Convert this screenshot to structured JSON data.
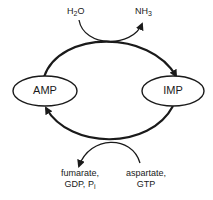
{
  "diagram": {
    "type": "purine nucleotide cycle",
    "nodes": [
      {
        "id": "amp",
        "label": "AMP"
      },
      {
        "id": "imp",
        "label": "IMP"
      }
    ],
    "top_reaction": {
      "input": {
        "base": "H",
        "sub": "2",
        "tail": "O"
      },
      "output": {
        "base": "NH",
        "sub": "3",
        "tail": ""
      },
      "direction": "AMP to IMP"
    },
    "bottom_reaction": {
      "inputs_line1": "aspartate,",
      "inputs_line2": "GTP",
      "outputs_line1": "fumarate,",
      "outputs_line2_prefix": "GDP, P",
      "outputs_line2_sub": "i",
      "direction": "IMP to AMP"
    },
    "colors": {
      "stroke": "#1a1a1a",
      "background": "#ffffff"
    }
  }
}
